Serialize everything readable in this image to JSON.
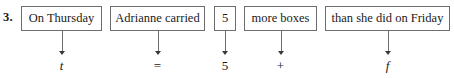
{
  "exercise": {
    "number_label": "3.",
    "kind": "word-problem-to-expression-translation",
    "colors": {
      "box_border": "#6e6e6e",
      "arrow": "#6e6e6e",
      "text": "#1a1a1a",
      "background": "#ffffff"
    },
    "phrases": [
      {
        "text": "On Thursday",
        "left": 21,
        "width": 81,
        "center": 61.5
      },
      {
        "text": "Adrianne carried",
        "left": 110,
        "width": 95,
        "center": 157.5
      },
      {
        "text": "5",
        "left": 214,
        "width": 22,
        "center": 225
      },
      {
        "text": "more boxes",
        "left": 244,
        "width": 73,
        "center": 280.5
      },
      {
        "text": "than she did on Friday",
        "left": 325,
        "width": 125,
        "center": 387.5
      }
    ],
    "symbols": [
      {
        "text": "t",
        "style": "variable",
        "center": 61.5
      },
      {
        "text": "=",
        "style": "operator",
        "center": 157.5
      },
      {
        "text": "5",
        "style": "numeric",
        "center": 225
      },
      {
        "text": "+",
        "style": "operator",
        "center": 280.5
      },
      {
        "text": "f",
        "style": "variable",
        "center": 387.5
      }
    ]
  }
}
